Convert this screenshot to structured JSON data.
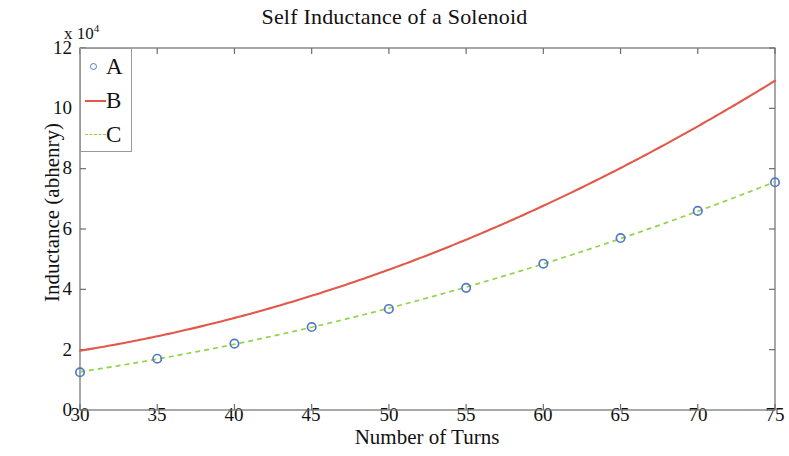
{
  "chart_data": {
    "type": "line",
    "title": "Self Inductance of a Solenoid",
    "xlabel": "Number of Turns",
    "ylabel": "Inductance (abhenry)",
    "y_exponent_label": "x 10",
    "y_exponent_power": "4",
    "xlim": [
      30,
      75
    ],
    "ylim": [
      0,
      12
    ],
    "xticks": [
      30,
      35,
      40,
      45,
      50,
      55,
      60,
      65,
      70,
      75
    ],
    "yticks": [
      0,
      2,
      4,
      6,
      8,
      10,
      12
    ],
    "grid": false,
    "legend_position": "upper-left",
    "x": [
      30,
      35,
      40,
      45,
      50,
      55,
      60,
      65,
      70,
      75
    ],
    "series": [
      {
        "name": "A",
        "style": "markers",
        "marker": "open-circle",
        "color": "#5577c8",
        "values": [
          1.25,
          1.7,
          2.2,
          2.75,
          3.35,
          4.05,
          4.85,
          5.7,
          6.6,
          7.55
        ]
      },
      {
        "name": "B",
        "style": "solid-line",
        "color": "#e2594a",
        "values": [
          1.9,
          2.45,
          3.1,
          3.85,
          4.7,
          5.65,
          6.7,
          7.9,
          9.4,
          11.0
        ]
      },
      {
        "name": "C",
        "style": "dashed-line",
        "color": "#8fd44a",
        "values": [
          1.25,
          1.7,
          2.2,
          2.75,
          3.35,
          4.05,
          4.85,
          5.7,
          6.6,
          7.55
        ]
      }
    ],
    "legend": [
      {
        "label": "A",
        "symbol": "open-circle-marker"
      },
      {
        "label": "B",
        "symbol": "solid-line"
      },
      {
        "label": "C",
        "symbol": "dashed-line"
      }
    ],
    "axis_color": "#6e6e6e",
    "text_color": "#111111"
  }
}
